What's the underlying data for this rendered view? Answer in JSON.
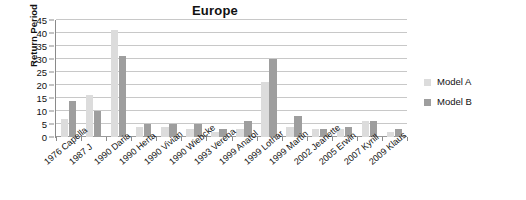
{
  "chart_data": {
    "type": "bar",
    "title": "Europe",
    "xlabel": "",
    "ylabel": "Return Period",
    "ylim": [
      0,
      45
    ],
    "ytick_step": 5,
    "yticks": [
      0,
      5,
      10,
      15,
      20,
      25,
      30,
      35,
      40,
      45
    ],
    "grid": true,
    "legend_position": "right",
    "categories": [
      "1976 Capella",
      "1987 J",
      "1990 Daria",
      "1990 Herta",
      "1990 Vivian",
      "1990 Wiebcke",
      "1993 Verena",
      "1999 Anatol",
      "1999 Lothar",
      "1999 Martin",
      "2002 Jeanette",
      "2005 Erwin",
      "2007 Kyrill",
      "2009 Klaus"
    ],
    "series": [
      {
        "name": "Model A",
        "color": "#dcdcdc",
        "values": [
          7,
          16,
          41,
          4,
          4,
          3,
          2,
          3,
          21,
          4,
          3,
          3,
          6,
          2
        ]
      },
      {
        "name": "Model B",
        "color": "#9e9e9e",
        "values": [
          14,
          10,
          31,
          5,
          5,
          5,
          3,
          6,
          30,
          8,
          3,
          4,
          6,
          3
        ]
      }
    ]
  },
  "legend": {
    "entries": [
      {
        "label": "Model A",
        "swatch": "light-gray-swatch"
      },
      {
        "label": "Model B",
        "swatch": "dark-gray-swatch"
      }
    ]
  },
  "colors": {
    "model_a": "#dcdcdc",
    "model_b": "#9e9e9e",
    "gridline": "#c8c8c8",
    "axis": "#8a8a8a",
    "text": "#111111",
    "background": "#ffffff"
  }
}
